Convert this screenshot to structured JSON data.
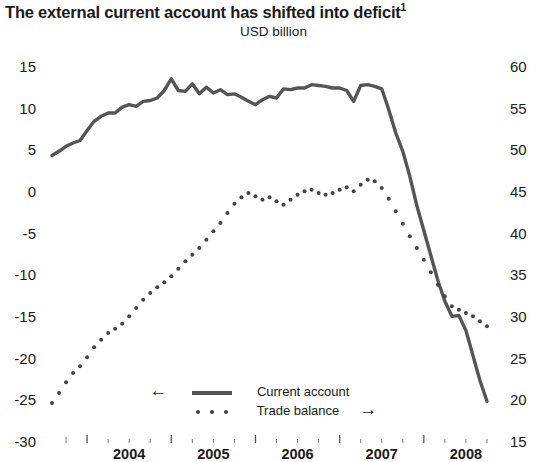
{
  "chart_data": {
    "type": "line",
    "title": "The external current account has shifted into deficit",
    "title_superscript": "1",
    "subtitle": "USD billion",
    "xlabel": "",
    "ylabel": "",
    "grid": false,
    "legend_position": "inside-bottom-left",
    "x_tick_labels": [
      "2004",
      "2005",
      "2006",
      "2007",
      "2008"
    ],
    "x_major_ticks": [
      "2004",
      "2005",
      "2006",
      "2007",
      "2008"
    ],
    "x_minor_ticks_per_year": 4,
    "xlim": [
      "2003-07",
      "2008-12"
    ],
    "left_axis": {
      "label": "",
      "ylim": [
        -30,
        15
      ],
      "tick_labels": [
        "15",
        "10",
        "5",
        "0",
        "-5",
        "-10",
        "-15",
        "-20",
        "-25",
        "-30"
      ],
      "tick_values": [
        15,
        10,
        5,
        0,
        -5,
        -10,
        -15,
        -20,
        -25,
        -30
      ]
    },
    "right_axis": {
      "label": "",
      "ylim": [
        15,
        60
      ],
      "tick_labels": [
        "60",
        "55",
        "50",
        "45",
        "40",
        "35",
        "30",
        "25",
        "20",
        "15"
      ],
      "tick_values": [
        60,
        55,
        50,
        45,
        40,
        35,
        30,
        25,
        20,
        15
      ]
    },
    "series": [
      {
        "name": "Current account",
        "axis": "left",
        "style": "solid",
        "color": "#555555",
        "arrow": "←",
        "x": [
          "2003-08",
          "2003-09",
          "2003-10",
          "2003-11",
          "2003-12",
          "2004-01",
          "2004-02",
          "2004-03",
          "2004-04",
          "2004-05",
          "2004-06",
          "2004-07",
          "2004-08",
          "2004-09",
          "2004-10",
          "2004-11",
          "2004-12",
          "2005-01",
          "2005-02",
          "2005-03",
          "2005-04",
          "2005-05",
          "2005-06",
          "2005-07",
          "2005-08",
          "2005-09",
          "2005-10",
          "2005-11",
          "2005-12",
          "2006-01",
          "2006-02",
          "2006-03",
          "2006-04",
          "2006-05",
          "2006-06",
          "2006-07",
          "2006-08",
          "2006-09",
          "2006-10",
          "2006-11",
          "2006-12",
          "2007-01",
          "2007-02",
          "2007-03",
          "2007-04",
          "2007-05",
          "2007-06",
          "2007-07",
          "2007-08",
          "2007-09",
          "2007-10",
          "2007-11",
          "2007-12",
          "2008-01",
          "2008-02",
          "2008-03",
          "2008-04",
          "2008-05",
          "2008-06",
          "2008-07",
          "2008-08",
          "2008-09",
          "2008-10"
        ],
        "values": [
          4.5,
          5.0,
          5.6,
          6.0,
          6.3,
          7.5,
          8.6,
          9.2,
          9.6,
          9.6,
          10.3,
          10.6,
          10.4,
          11.0,
          11.1,
          11.4,
          12.3,
          13.7,
          12.3,
          12.2,
          13.1,
          11.9,
          12.7,
          12.0,
          12.4,
          11.8,
          11.9,
          11.5,
          11.0,
          10.6,
          11.2,
          11.6,
          11.4,
          12.5,
          12.4,
          12.6,
          12.6,
          13.0,
          12.9,
          12.8,
          12.6,
          12.6,
          12.3,
          11.0,
          12.9,
          13.0,
          12.8,
          12.5,
          10.0,
          7.2,
          5.0,
          2.0,
          -1.5,
          -4.5,
          -7.5,
          -10.5,
          -13.0,
          -14.8,
          -14.7,
          -16.5,
          -19.5,
          -22.5,
          -25.0
        ]
      },
      {
        "name": "Trade balance",
        "axis": "right",
        "style": "dotted",
        "color": "#444444",
        "arrow": "→",
        "x": [
          "2003-08",
          "2003-09",
          "2003-10",
          "2003-11",
          "2003-12",
          "2004-01",
          "2004-02",
          "2004-03",
          "2004-04",
          "2004-05",
          "2004-06",
          "2004-07",
          "2004-08",
          "2004-09",
          "2004-10",
          "2004-11",
          "2004-12",
          "2005-01",
          "2005-02",
          "2005-03",
          "2005-04",
          "2005-05",
          "2005-06",
          "2005-07",
          "2005-08",
          "2005-09",
          "2005-10",
          "2005-11",
          "2005-12",
          "2006-01",
          "2006-02",
          "2006-03",
          "2006-04",
          "2006-05",
          "2006-06",
          "2006-07",
          "2006-08",
          "2006-09",
          "2006-10",
          "2006-11",
          "2006-12",
          "2007-01",
          "2007-02",
          "2007-03",
          "2007-04",
          "2007-05",
          "2007-06",
          "2007-07",
          "2007-08",
          "2007-09",
          "2007-10",
          "2007-11",
          "2007-12",
          "2008-01",
          "2008-02",
          "2008-03",
          "2008-04",
          "2008-05",
          "2008-06",
          "2008-07",
          "2008-08",
          "2008-09",
          "2008-10"
        ],
        "values": [
          19.8,
          21.0,
          22.3,
          23.4,
          24.2,
          25.3,
          26.5,
          27.4,
          28.2,
          28.7,
          29.3,
          30.2,
          31.2,
          32.2,
          33.0,
          33.7,
          34.3,
          35.0,
          35.9,
          36.8,
          37.6,
          38.4,
          39.4,
          40.4,
          41.4,
          42.6,
          43.7,
          44.5,
          45.0,
          44.6,
          44.2,
          44.5,
          44.0,
          43.6,
          44.2,
          44.8,
          45.2,
          45.4,
          45.0,
          44.8,
          45.0,
          45.4,
          45.7,
          45.2,
          46.0,
          46.6,
          46.4,
          45.6,
          44.3,
          42.8,
          41.3,
          39.8,
          38.4,
          37.0,
          35.5,
          34.0,
          32.6,
          31.4,
          31.0,
          30.6,
          30.2,
          29.6,
          29.0
        ]
      }
    ],
    "annotations": []
  },
  "legend": {
    "current_account": {
      "label": "Current account",
      "arrow": "←",
      "marker": "solid-line"
    },
    "trade_balance": {
      "label": "Trade balance",
      "arrow": "→",
      "marker": "dotted-line"
    }
  }
}
